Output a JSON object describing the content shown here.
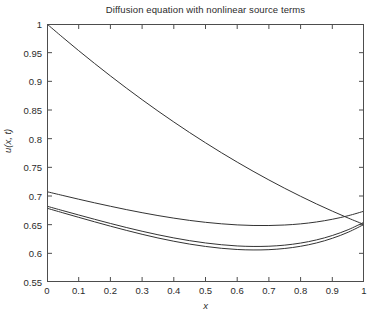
{
  "figure": {
    "background_color": "#ffffff",
    "axis_color": "#4d4d4d",
    "line_color": "#333333"
  },
  "chart_data": {
    "type": "line",
    "title": "Diffusion equation with nonlinear source terms",
    "xlabel": "x",
    "ylabel": "u(x, t)",
    "xlim": [
      0,
      1
    ],
    "ylim": [
      0.55,
      1
    ],
    "grid": false,
    "legend": null,
    "xticks": [
      0,
      0.1,
      0.2,
      0.3,
      0.4,
      0.5,
      0.6,
      0.7,
      0.8,
      0.9,
      1
    ],
    "xticklabels": [
      "0",
      "0.1",
      "0.2",
      "0.3",
      "0.4",
      "0.5",
      "0.6",
      "0.7",
      "0.8",
      "0.9",
      "1"
    ],
    "yticks": [
      0.55,
      0.6,
      0.65,
      0.7,
      0.75,
      0.8,
      0.85,
      0.9,
      0.95,
      1
    ],
    "yticklabels": [
      "0.55",
      "0.6",
      "0.65",
      "0.7",
      "0.75",
      "0.8",
      "0.85",
      "0.9",
      "0.95",
      "1"
    ],
    "x": [
      0,
      0.05,
      0.1,
      0.15,
      0.2,
      0.25,
      0.3,
      0.35,
      0.4,
      0.45,
      0.5,
      0.55,
      0.6,
      0.65,
      0.7,
      0.75,
      0.8,
      0.85,
      0.9,
      0.95,
      1
    ],
    "series": [
      {
        "name": "t = t1 (initial, monotone decreasing)",
        "values": [
          1.0,
          0.9765,
          0.9535,
          0.9312,
          0.9095,
          0.8884,
          0.868,
          0.8482,
          0.8291,
          0.8106,
          0.7928,
          0.7756,
          0.7591,
          0.7432,
          0.728,
          0.7134,
          0.6995,
          0.6862,
          0.6736,
          0.6616,
          0.6503
        ]
      },
      {
        "name": "t = t2 (upper U-shaped profile)",
        "values": [
          0.7075,
          0.7009,
          0.6944,
          0.6881,
          0.6821,
          0.6763,
          0.6709,
          0.6659,
          0.6614,
          0.6574,
          0.6541,
          0.6515,
          0.6496,
          0.6486,
          0.6485,
          0.6494,
          0.6514,
          0.6547,
          0.6594,
          0.6656,
          0.6735
        ]
      },
      {
        "name": "t = t3 (middle U-shaped profile)",
        "values": [
          0.6822,
          0.6745,
          0.6669,
          0.6594,
          0.6521,
          0.6451,
          0.6385,
          0.6324,
          0.6269,
          0.6221,
          0.6181,
          0.615,
          0.6129,
          0.612,
          0.6124,
          0.6143,
          0.6179,
          0.6234,
          0.6311,
          0.6412,
          0.6542
        ]
      },
      {
        "name": "t = t4 (lower U-shaped profile)",
        "values": [
          0.6787,
          0.6707,
          0.6628,
          0.655,
          0.6474,
          0.6401,
          0.6332,
          0.6268,
          0.6211,
          0.6161,
          0.612,
          0.6088,
          0.6067,
          0.6059,
          0.6064,
          0.6085,
          0.6123,
          0.6181,
          0.6262,
          0.6368,
          0.6504
        ]
      }
    ],
    "annotations": [
      {
        "text": "decreasing curve crosses upper profile near x = 0.75"
      },
      {
        "text": "decreasing curve crosses lower profiles near x = 0.80"
      }
    ]
  }
}
